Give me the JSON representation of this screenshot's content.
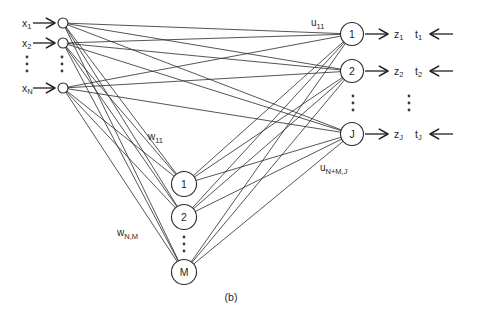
{
  "figure": {
    "caption": "(b)",
    "colors": {
      "stroke": "#1f1f1f",
      "background": "#ffffff"
    },
    "inputs": [
      {
        "base": "x",
        "sub": "1"
      },
      {
        "base": "x",
        "sub": "2"
      },
      {
        "base": "x",
        "sub": "N"
      }
    ],
    "hidden_nodes": [
      "1",
      "2",
      "M"
    ],
    "output_nodes": [
      "1",
      "2",
      "J"
    ],
    "z_outputs": [
      {
        "base": "z",
        "sub": "1"
      },
      {
        "base": "z",
        "sub": "2"
      },
      {
        "base": "z",
        "sub": "J"
      }
    ],
    "t_targets": [
      {
        "base": "t",
        "sub": "1"
      },
      {
        "base": "t",
        "sub": "2"
      },
      {
        "base": "t",
        "sub": "J"
      }
    ],
    "weights": {
      "input_hidden_first": {
        "base": "w",
        "sub": "11"
      },
      "input_hidden_last": {
        "base": "w",
        "sub": "N,M"
      },
      "output_first": {
        "base": "u",
        "sub": "11"
      },
      "output_last": {
        "base": "u",
        "sub": "N+M,J"
      }
    }
  }
}
